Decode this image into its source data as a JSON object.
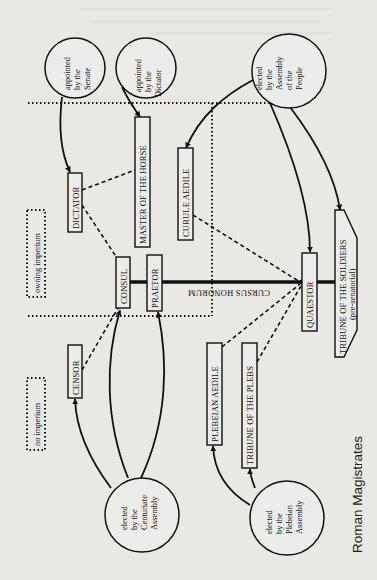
{
  "figure": {
    "title": "Roman Magistrates",
    "axis_label": "CURSUS HONORUM",
    "orientation": "rotated 90° counter-clockwise"
  },
  "legend": {
    "owning_imperium": "owning imperium",
    "no_imperium": "no imperium"
  },
  "sources": {
    "senate": [
      "appointed",
      "by the",
      "Senate"
    ],
    "dictator": [
      "appointed",
      "by the",
      "Dictator"
    ],
    "people": [
      "elected",
      "by the",
      "Assembly",
      "of the",
      "People"
    ],
    "centuriate": [
      "elected",
      "by the",
      "Centuriate",
      "Assembly"
    ],
    "plebeian": [
      "elected",
      "by the",
      "Plebeian",
      "Assembly"
    ]
  },
  "offices": {
    "dictator": "DICTATOR",
    "master_of_horse": "MASTER OF THE HORSE",
    "curule_aedile": "CURULE AEDILE",
    "consul": "CONSUL",
    "praetor": "PRAETOR",
    "censor": "CENSOR",
    "plebeian_aedile": "PLEBEIAN AEDILE",
    "tribune_plebs": "TRIBUNE OF THE PLEBS",
    "quaestor": "QUAESTOR",
    "tribune_soldiers": "TRIBUNE OF THE SOLDIERS",
    "tribune_soldiers_note": "(pre-senatorial)"
  },
  "connections": [
    {
      "from": "senate",
      "to": "dictator",
      "type": "appointment-arrow"
    },
    {
      "from": "dictator",
      "to": "master_of_horse",
      "type": "appointment-arrow"
    },
    {
      "from": "people",
      "to": "curule_aedile",
      "type": "election-arrow"
    },
    {
      "from": "people",
      "to": "quaestor",
      "type": "election-arrow"
    },
    {
      "from": "people",
      "to": "tribune_soldiers",
      "type": "election-arrow"
    },
    {
      "from": "centuriate",
      "to": "censor",
      "type": "election-arrow"
    },
    {
      "from": "centuriate",
      "to": "consul",
      "type": "election-arrow"
    },
    {
      "from": "centuriate",
      "to": "praetor",
      "type": "election-arrow"
    },
    {
      "from": "plebeian",
      "to": "plebeian_aedile",
      "type": "election-arrow"
    },
    {
      "from": "plebeian",
      "to": "tribune_plebs",
      "type": "election-arrow"
    },
    {
      "from": "dictator",
      "to": "master_of_horse",
      "type": "dashed"
    },
    {
      "from": "dictator",
      "to": "consul",
      "type": "dashed"
    },
    {
      "from": "censor",
      "to": "consul",
      "type": "dashed"
    },
    {
      "from": "curule_aedile",
      "to": "quaestor",
      "type": "dashed"
    },
    {
      "from": "plebeian_aedile",
      "to": "quaestor",
      "type": "dashed"
    },
    {
      "from": "tribune_plebs",
      "to": "quaestor",
      "type": "dashed"
    },
    {
      "from": "quaestor",
      "to": "consul",
      "type": "cursus-honorum"
    },
    {
      "from": "quaestor",
      "to": "tribune_soldiers",
      "type": "cursus-honorum"
    }
  ]
}
